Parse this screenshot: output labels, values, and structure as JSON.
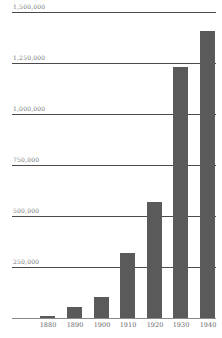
{
  "chart_data": {
    "type": "bar",
    "title": "",
    "xlabel": "",
    "ylabel": "",
    "categories": [
      "1880",
      "1890",
      "1900",
      "1910",
      "1920",
      "1930",
      "1940"
    ],
    "values": [
      10000,
      54000,
      103000,
      319000,
      569000,
      1230000,
      1407000
    ],
    "ylim": [
      0,
      1500000
    ],
    "yticks": [
      250000,
      500000,
      750000,
      1000000,
      1250000,
      1500000
    ],
    "ytick_labels": [
      "250,000",
      "500,000",
      "750,000",
      "1,000,000",
      "1,250,000",
      "1,500,000"
    ],
    "grid": true,
    "legend": null,
    "bar_color": "#5a5a5a"
  }
}
